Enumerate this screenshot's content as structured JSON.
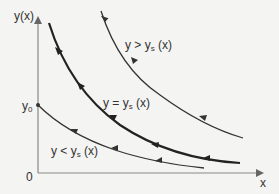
{
  "diagram": {
    "type": "phase-trajectories",
    "axes": {
      "y_label": "y(x)",
      "x_label": "x",
      "origin_label": "0",
      "y0_label_base": "y",
      "y0_label_sub": "0"
    },
    "curves": [
      {
        "id": "upper",
        "label_prefix": "y > y",
        "label_sub": "s",
        "label_suffix": " (x)",
        "style": "thin"
      },
      {
        "id": "separatrix",
        "label_prefix": "y = y",
        "label_sub": "s",
        "label_suffix": " (x)",
        "style": "thick"
      },
      {
        "id": "lower",
        "label_prefix": "y < y",
        "label_sub": "s",
        "label_suffix": " (x)",
        "style": "thin"
      }
    ],
    "colors": {
      "background": "#f4f4f2",
      "curve": "#333333",
      "axis": "#777777",
      "text": "#333333"
    }
  }
}
